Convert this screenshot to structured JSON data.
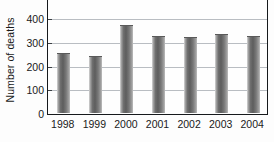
{
  "chart_data": {
    "type": "bar",
    "title": "",
    "subtitle": "",
    "xlabel": "",
    "ylabel": "Number of deaths",
    "categories": [
      "1998",
      "1999",
      "2000",
      "2001",
      "2002",
      "2003",
      "2004"
    ],
    "values": [
      250,
      235,
      365,
      320,
      317,
      327,
      320
    ],
    "series": [
      {
        "name": "Number of deaths",
        "values": [
          250,
          235,
          365,
          320,
          317,
          327,
          320
        ]
      }
    ],
    "ylim": [
      0,
      420
    ],
    "yticks": [
      0,
      100,
      200,
      300,
      400
    ],
    "ytick_labels": [
      "0",
      "100",
      "200",
      "300",
      "400"
    ],
    "grid": true,
    "grid_axis": "y",
    "legend": false,
    "legend_position": "none",
    "bar_color": "#6f6f6f",
    "bar_style": "vertical-gradient-gray",
    "axis_color": "#16191c",
    "gridline_color": "#b9bdc2",
    "background_color": "#fefefe"
  },
  "axes": {
    "y_title": "Number of deaths",
    "y_ticks": [
      {
        "label": "400",
        "value": 400
      },
      {
        "label": "300",
        "value": 300
      },
      {
        "label": "200",
        "value": 200
      },
      {
        "label": "100",
        "value": 100
      },
      {
        "label": "0",
        "value": 0
      }
    ],
    "x_ticks": [
      {
        "label": "1998"
      },
      {
        "label": "1999"
      },
      {
        "label": "2000"
      },
      {
        "label": "2001"
      },
      {
        "label": "2002"
      },
      {
        "label": "2003"
      },
      {
        "label": "2004"
      }
    ]
  }
}
